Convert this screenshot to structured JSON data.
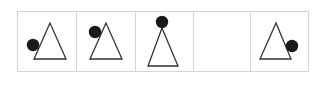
{
  "puzzle": {
    "border_color": "#d4d4d4",
    "shape_color": "#333333",
    "dot_color": "#1a1a1a",
    "cells": [
      {
        "x": 17,
        "w": 59,
        "empty": false,
        "triangle": [
          [
            50,
            23
          ],
          [
            34,
            59
          ],
          [
            66,
            59
          ]
        ],
        "dot": {
          "cx": 33,
          "cy": 45,
          "r": 6.2
        }
      },
      {
        "x": 76,
        "w": 59,
        "empty": false,
        "triangle": [
          [
            106,
            23
          ],
          [
            90,
            59
          ],
          [
            122,
            59
          ]
        ],
        "dot": {
          "cx": 95,
          "cy": 32,
          "r": 6.2
        }
      },
      {
        "x": 135,
        "w": 58,
        "empty": false,
        "triangle": [
          [
            162,
            28
          ],
          [
            148,
            66
          ],
          [
            178,
            66
          ]
        ],
        "dot": {
          "cx": 162,
          "cy": 22,
          "r": 6.2
        }
      },
      {
        "x": 193,
        "w": 57,
        "empty": true
      },
      {
        "x": 250,
        "w": 58,
        "empty": false,
        "triangle": [
          [
            276,
            23
          ],
          [
            260,
            59
          ],
          [
            291,
            59
          ]
        ],
        "dot": {
          "cx": 292,
          "cy": 46,
          "r": 6.2
        }
      }
    ],
    "top": 11,
    "height": 60
  }
}
